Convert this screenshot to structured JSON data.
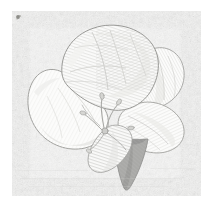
{
  "figure": {
    "medium": "faded engraving / stipple print on speckled paper",
    "width_px": 213,
    "height_px": 206,
    "alt_text": "Pale, faded botanical engraving of an open flower with broad overlapping petals, radiating stamens at the center and one dark grey pointed sepal hanging below, printed on lightly speckled off-white paper."
  },
  "palette": {
    "page_white": "#ffffff",
    "paper_base": "#f2f2f1",
    "paper_speck_light": "#e8e8e7",
    "paper_speck_dark": "#c9c9c8",
    "petal_fill": "#fbfbfa",
    "petal_shade_light": "#ededeb",
    "petal_shade_mid": "#dededc",
    "hatch_line": "#c4c4c1",
    "outline_stroke": "#9a9a97",
    "outline_stroke_soft": "#b4b4b1",
    "sepal_dark": "#a8a8a6",
    "sepal_dark_edge": "#8e8e8c",
    "stamen_line": "#a9a9a6",
    "ink_speck": "#6f6f6d"
  },
  "plate": {
    "margin_left_px": 13,
    "margin_top_px": 12,
    "textured_width_px": 187,
    "textured_height_px": 183
  },
  "elements": {
    "flower_label": "flower",
    "petal_top_label": "upper petal",
    "petal_left_label": "left petal",
    "petal_right_upper_label": "upper right petal",
    "petal_right_lower_label": "lower right petal",
    "petal_lower_center_label": "lower center petal",
    "sepal_label": "dark sepal",
    "stamens_label": "stamens",
    "speck_label": "ink speck"
  }
}
